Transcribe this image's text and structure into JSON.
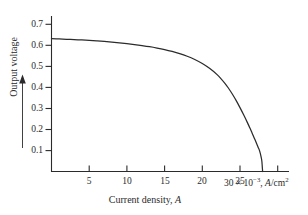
{
  "figure": {
    "background_color": "#ffffff",
    "line_color": "#2b2b2b",
    "axis_color": "#2b2b2b"
  },
  "axes": {
    "y_caption": "Output voltage",
    "y_arrow": "upward-arrow",
    "x_caption_prefix": "Current density, ",
    "x_caption_symbol": "A",
    "x_unit_value": "30",
    "x_unit_times": "×",
    "x_unit_base": "10",
    "x_unit_exponent": "−3",
    "x_unit_comma": ", ",
    "x_unit_symbol": "A",
    "x_unit_per": "/cm",
    "x_unit_square": "2"
  },
  "chart_data": {
    "type": "line",
    "title": "",
    "subtitle": "",
    "xlabel": "Current density, A",
    "ylabel": "Output voltage",
    "x_unit": "×10⁻³ A/cm²",
    "y_unit": "V",
    "xlim": [
      0,
      31.5
    ],
    "ylim": [
      0,
      0.755
    ],
    "xticks": [
      5,
      10,
      15,
      20,
      25,
      30
    ],
    "xticklabels": [
      "5",
      "10",
      "15",
      "20",
      "25",
      "30"
    ],
    "yticks": [
      0.1,
      0.2,
      0.3,
      0.4,
      0.5,
      0.6,
      0.7
    ],
    "yticklabels": [
      "0.1",
      "0.2",
      "0.3",
      "0.4",
      "0.5",
      "0.6",
      "0.7"
    ],
    "grid": false,
    "legend": false,
    "legend_position": "none",
    "tick_direction": "out",
    "spines": [
      "left",
      "bottom"
    ],
    "annotations": [],
    "series": [
      {
        "name": "solar cell I-V characteristic",
        "x": [
          0.0,
          1.0,
          2.0,
          3.0,
          4.0,
          5.0,
          6.0,
          7.0,
          8.0,
          9.0,
          10.0,
          11.0,
          12.0,
          13.0,
          14.0,
          15.0,
          16.0,
          17.0,
          18.0,
          19.0,
          20.0,
          21.0,
          22.0,
          23.0,
          23.5,
          24.0,
          24.5,
          25.0,
          25.5,
          26.0,
          26.3,
          26.6,
          26.9,
          27.2,
          27.4,
          27.6,
          27.8,
          27.9,
          28.0
        ],
        "y": [
          0.645,
          0.6435,
          0.642,
          0.6405,
          0.6385,
          0.6365,
          0.634,
          0.6315,
          0.6285,
          0.625,
          0.621,
          0.6165,
          0.6115,
          0.606,
          0.5995,
          0.592,
          0.583,
          0.5725,
          0.5595,
          0.5435,
          0.524,
          0.4995,
          0.469,
          0.428,
          0.403,
          0.375,
          0.344,
          0.31,
          0.274,
          0.236,
          0.212,
          0.187,
          0.162,
          0.136,
          0.118,
          0.1,
          0.071,
          0.05,
          0.0
        ]
      }
    ]
  }
}
